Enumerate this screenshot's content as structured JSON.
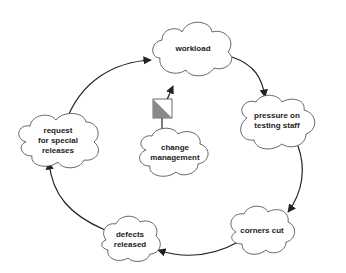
{
  "diagram": {
    "type": "causal-loop",
    "colors": {
      "line": "#222222",
      "cloud_stroke": "#555555",
      "cloud_fill": "#ffffff",
      "valve_dark": "#8a8a8a",
      "valve_light": "#ffffff",
      "text": "#222222"
    },
    "nodes": {
      "workload": "workload",
      "pressure": "pressure on\ntesting staff",
      "corners": "corners cut",
      "defects": "defects\nreleased",
      "request": "request\nfor special\nreleases",
      "change": "change\nmanagement"
    },
    "edges": [
      {
        "from": "workload",
        "to": "pressure"
      },
      {
        "from": "pressure",
        "to": "corners"
      },
      {
        "from": "corners",
        "to": "defects"
      },
      {
        "from": "defects",
        "to": "request"
      },
      {
        "from": "request",
        "to": "workload"
      },
      {
        "from": "change",
        "to": "workload",
        "via": "valve"
      }
    ],
    "valve": {
      "symbol": "half-shaded-square"
    }
  }
}
